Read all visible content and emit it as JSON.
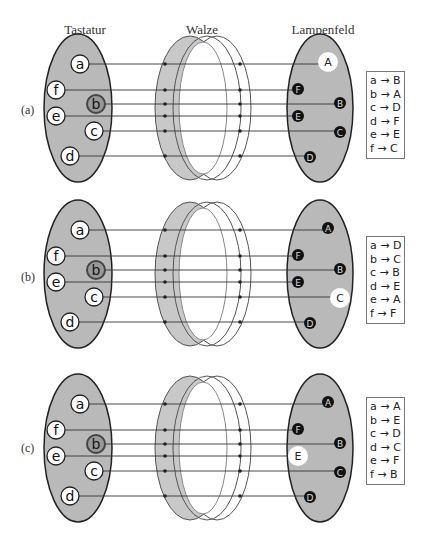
{
  "headers": {
    "keyboard": "Tastatur",
    "rotor": "Walze",
    "lampboard": "Lampenfeld"
  },
  "colors": {
    "disc_fill": "#b9b9b9",
    "disc_edge": "#222222",
    "rotor_fill": "#c8c8c8",
    "wire": "#333333",
    "lamp_glow": "#ffffff"
  },
  "keyboard_keys": [
    "a",
    "f",
    "b",
    "e",
    "c",
    "d"
  ],
  "lamp_labels": [
    "A",
    "F",
    "B",
    "E",
    "C",
    "D"
  ],
  "rows": [
    {
      "label": "(a)",
      "pressed_key": "b",
      "lit_lamp": "A",
      "mapping": [
        "a → B",
        "b → A",
        "c → D",
        "d → F",
        "e → E",
        "f → C"
      ]
    },
    {
      "label": "(b)",
      "pressed_key": "b",
      "lit_lamp": "C",
      "mapping": [
        "a → D",
        "b → C",
        "c → B",
        "d → E",
        "e → A",
        "f → F"
      ]
    },
    {
      "label": "(c)",
      "pressed_key": "b",
      "lit_lamp": "E",
      "mapping": [
        "a → A",
        "b → E",
        "c → D",
        "d → C",
        "e → F",
        "f → B"
      ]
    }
  ]
}
